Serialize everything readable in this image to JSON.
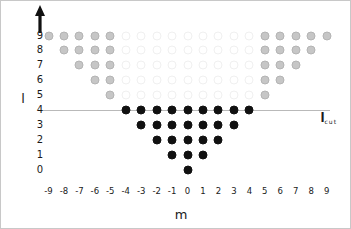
{
  "chart_data": {
    "type": "scatter",
    "title": "",
    "xlabel": "m",
    "ylabel": "l",
    "xlim": [
      -9.8,
      9.8
    ],
    "ylim": [
      -0.8,
      9.8
    ],
    "grid": false,
    "legend": null,
    "x_ticks": [
      "-9",
      "-8",
      "-7",
      "-6",
      "-5",
      "-4",
      "-3",
      "-2",
      "-1",
      "0",
      "1",
      "2",
      "3",
      "4",
      "5",
      "6",
      "7",
      "8",
      "9"
    ],
    "x_tick_values": [
      -9,
      -8,
      -7,
      -6,
      -5,
      -4,
      -3,
      -2,
      -1,
      0,
      1,
      2,
      3,
      4,
      5,
      6,
      7,
      8,
      9
    ],
    "y_ticks": [
      "9",
      "8",
      "7",
      "6",
      "5",
      "4",
      "3",
      "2",
      "1",
      "0"
    ],
    "y_tick_values": [
      9,
      8,
      7,
      6,
      5,
      4,
      3,
      2,
      1,
      0
    ],
    "annotations": [
      {
        "text": "l",
        "subscript": "cut",
        "name": "l-cut-label",
        "x": 8.6,
        "y": 3.45
      }
    ],
    "cut_line": {
      "y": 4,
      "x_start": -9.7,
      "x_end": 9.2,
      "color": "#b9b9b9"
    },
    "colors": {
      "filled": "#111111",
      "gray": "#c6c6c6",
      "faint": "#f0f0f0",
      "axis": "#1a1a1a",
      "cut_line": "#b9b9b9"
    },
    "series": [
      {
        "name": "retained states (filled)",
        "style": "filled",
        "points": [
          {
            "m": -4,
            "l": 4
          },
          {
            "m": -3,
            "l": 4
          },
          {
            "m": -2,
            "l": 4
          },
          {
            "m": -1,
            "l": 4
          },
          {
            "m": 0,
            "l": 4
          },
          {
            "m": 1,
            "l": 4
          },
          {
            "m": 2,
            "l": 4
          },
          {
            "m": 3,
            "l": 4
          },
          {
            "m": 4,
            "l": 4
          },
          {
            "m": -3,
            "l": 3
          },
          {
            "m": -2,
            "l": 3
          },
          {
            "m": -1,
            "l": 3
          },
          {
            "m": 0,
            "l": 3
          },
          {
            "m": 1,
            "l": 3
          },
          {
            "m": 2,
            "l": 3
          },
          {
            "m": 3,
            "l": 3
          },
          {
            "m": -2,
            "l": 2
          },
          {
            "m": -1,
            "l": 2
          },
          {
            "m": 0,
            "l": 2
          },
          {
            "m": 1,
            "l": 2
          },
          {
            "m": 2,
            "l": 2
          },
          {
            "m": -1,
            "l": 1
          },
          {
            "m": 0,
            "l": 1
          },
          {
            "m": 1,
            "l": 1
          },
          {
            "m": 0,
            "l": 0
          }
        ]
      },
      {
        "name": "discarded states (gray)",
        "style": "gray",
        "points": [
          {
            "m": -9,
            "l": 9
          },
          {
            "m": -8,
            "l": 9
          },
          {
            "m": -7,
            "l": 9
          },
          {
            "m": -6,
            "l": 9
          },
          {
            "m": -5,
            "l": 9
          },
          {
            "m": 5,
            "l": 9
          },
          {
            "m": 6,
            "l": 9
          },
          {
            "m": 7,
            "l": 9
          },
          {
            "m": 8,
            "l": 9
          },
          {
            "m": 9,
            "l": 9
          },
          {
            "m": -8,
            "l": 8
          },
          {
            "m": -7,
            "l": 8
          },
          {
            "m": -6,
            "l": 8
          },
          {
            "m": -5,
            "l": 8
          },
          {
            "m": 5,
            "l": 8
          },
          {
            "m": 6,
            "l": 8
          },
          {
            "m": 7,
            "l": 8
          },
          {
            "m": 8,
            "l": 8
          },
          {
            "m": -7,
            "l": 7
          },
          {
            "m": -6,
            "l": 7
          },
          {
            "m": -5,
            "l": 7
          },
          {
            "m": 5,
            "l": 7
          },
          {
            "m": 6,
            "l": 7
          },
          {
            "m": 7,
            "l": 7
          },
          {
            "m": -6,
            "l": 6
          },
          {
            "m": -5,
            "l": 6
          },
          {
            "m": 5,
            "l": 6
          },
          {
            "m": 6,
            "l": 6
          },
          {
            "m": -5,
            "l": 5
          },
          {
            "m": 5,
            "l": 5
          }
        ]
      },
      {
        "name": "open states (faint)",
        "style": "faint",
        "points": [
          {
            "m": -4,
            "l": 9
          },
          {
            "m": -3,
            "l": 9
          },
          {
            "m": -2,
            "l": 9
          },
          {
            "m": -1,
            "l": 9
          },
          {
            "m": 0,
            "l": 9
          },
          {
            "m": 1,
            "l": 9
          },
          {
            "m": 2,
            "l": 9
          },
          {
            "m": 3,
            "l": 9
          },
          {
            "m": 4,
            "l": 9
          },
          {
            "m": -4,
            "l": 8
          },
          {
            "m": -3,
            "l": 8
          },
          {
            "m": -2,
            "l": 8
          },
          {
            "m": -1,
            "l": 8
          },
          {
            "m": 0,
            "l": 8
          },
          {
            "m": 1,
            "l": 8
          },
          {
            "m": 2,
            "l": 8
          },
          {
            "m": 3,
            "l": 8
          },
          {
            "m": 4,
            "l": 8
          },
          {
            "m": -4,
            "l": 7
          },
          {
            "m": -3,
            "l": 7
          },
          {
            "m": -2,
            "l": 7
          },
          {
            "m": -1,
            "l": 7
          },
          {
            "m": 0,
            "l": 7
          },
          {
            "m": 1,
            "l": 7
          },
          {
            "m": 2,
            "l": 7
          },
          {
            "m": 3,
            "l": 7
          },
          {
            "m": 4,
            "l": 7
          },
          {
            "m": -4,
            "l": 6
          },
          {
            "m": -3,
            "l": 6
          },
          {
            "m": -2,
            "l": 6
          },
          {
            "m": -1,
            "l": 6
          },
          {
            "m": 0,
            "l": 6
          },
          {
            "m": 1,
            "l": 6
          },
          {
            "m": 2,
            "l": 6
          },
          {
            "m": 3,
            "l": 6
          },
          {
            "m": 4,
            "l": 6
          },
          {
            "m": -4,
            "l": 5
          },
          {
            "m": -3,
            "l": 5
          },
          {
            "m": -2,
            "l": 5
          },
          {
            "m": -1,
            "l": 5
          },
          {
            "m": 0,
            "l": 5
          },
          {
            "m": 1,
            "l": 5
          },
          {
            "m": 2,
            "l": 5
          },
          {
            "m": 3,
            "l": 5
          },
          {
            "m": 4,
            "l": 5
          }
        ]
      }
    ]
  }
}
